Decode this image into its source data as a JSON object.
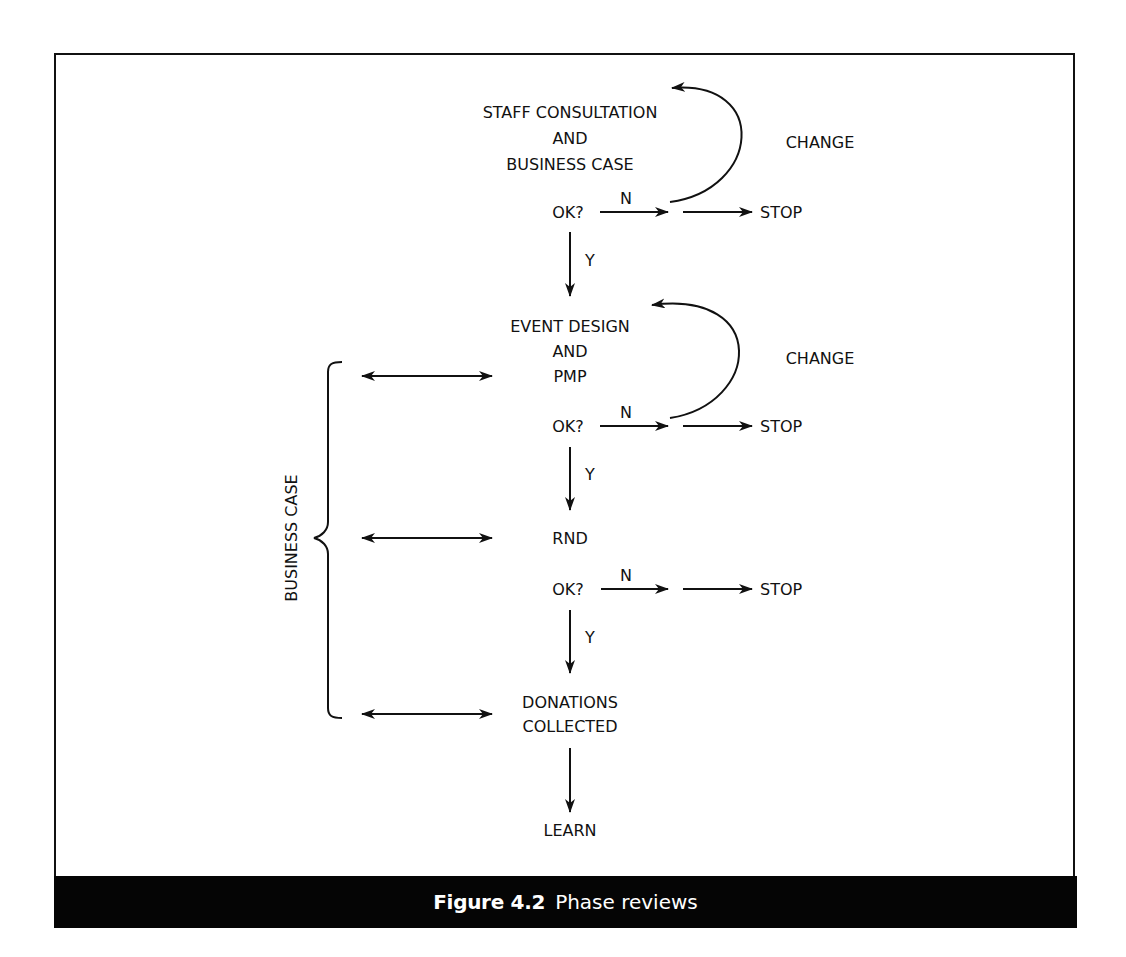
{
  "figure": {
    "number_label": "Figure 4.2",
    "title": "Phase reviews"
  },
  "stages": [
    {
      "id": "stage-1",
      "lines": [
        "STAFF CONSULTATION",
        "AND",
        "BUSINESS CASE"
      ],
      "has_change_loop": true
    },
    {
      "id": "stage-2",
      "lines": [
        "EVENT DESIGN",
        "AND",
        "PMP"
      ],
      "has_change_loop": true
    },
    {
      "id": "stage-3",
      "lines": [
        "RND"
      ],
      "has_change_loop": false
    },
    {
      "id": "stage-4",
      "lines": [
        "DONATIONS",
        "COLLECTED"
      ],
      "has_change_loop": false
    },
    {
      "id": "stage-5",
      "lines": [
        "LEARN"
      ],
      "has_change_loop": false
    }
  ],
  "decision": {
    "question": "OK?",
    "yes_label": "Y",
    "no_label": "N",
    "stop_label": "STOP",
    "change_label": "CHANGE"
  },
  "side_bracket": {
    "label": "BUSINESS CASE"
  },
  "colors": {
    "ink": "#111111",
    "background": "#ffffff",
    "caption_bar": "#050505",
    "caption_text": "#ffffff"
  }
}
